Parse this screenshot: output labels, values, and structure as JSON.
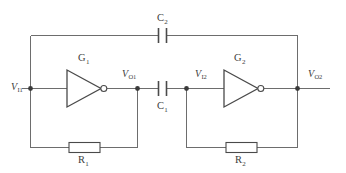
{
  "figure": {
    "type": "circuit-schematic",
    "width": 346,
    "height": 173,
    "background_color": "#ffffff",
    "wire_color": "#6d6d6d",
    "component_color": "#4a4a4a",
    "label_color": "#3d3d3d"
  },
  "nodes": [
    {
      "id": "vi1",
      "label": "V",
      "subscript": "I1",
      "x": 30,
      "y": 88
    },
    {
      "id": "vo1",
      "label": "V",
      "subscript": "O1",
      "x": 137,
      "y": 88
    },
    {
      "id": "vi2",
      "label": "V",
      "subscript": "I2",
      "x": 186,
      "y": 88
    },
    {
      "id": "vo2",
      "label": "V",
      "subscript": "O2",
      "x": 297,
      "y": 88
    }
  ],
  "gates": [
    {
      "id": "g1",
      "label": "G",
      "subscript": "1",
      "type": "inverter",
      "x": 84,
      "y": 88
    },
    {
      "id": "g2",
      "label": "G",
      "subscript": "2",
      "type": "inverter",
      "x": 241,
      "y": 88
    }
  ],
  "capacitors": [
    {
      "id": "c1",
      "label": "C",
      "subscript": "1",
      "x": 162,
      "y": 88,
      "orientation": "horizontal",
      "label_position": "below"
    },
    {
      "id": "c2",
      "label": "C",
      "subscript": "2",
      "x": 162,
      "y": 35,
      "orientation": "horizontal",
      "label_position": "above"
    }
  ],
  "resistors": [
    {
      "id": "r1",
      "label": "R",
      "subscript": "1",
      "x": 84,
      "y": 147,
      "orientation": "horizontal",
      "label_position": "below"
    },
    {
      "id": "r2",
      "label": "R",
      "subscript": "2",
      "x": 241,
      "y": 147,
      "orientation": "horizontal",
      "label_position": "below"
    }
  ],
  "labels": {
    "vi1": "V",
    "vi1_sub": "I1",
    "vo1": "V",
    "vo1_sub": "O1",
    "vi2": "V",
    "vi2_sub": "I2",
    "vo2": "V",
    "vo2_sub": "O2",
    "g1": "G",
    "g1_sub": "1",
    "g2": "G",
    "g2_sub": "2",
    "c1": "C",
    "c1_sub": "1",
    "c2": "C",
    "c2_sub": "2",
    "r1": "R",
    "r1_sub": "1",
    "r2": "R",
    "r2_sub": "2"
  }
}
